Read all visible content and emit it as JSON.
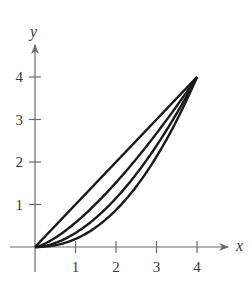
{
  "chart_data": {
    "type": "line",
    "title": "",
    "xlabel": "x",
    "ylabel": "y",
    "xlim": [
      0,
      4.6
    ],
    "ylim": [
      0,
      4.6
    ],
    "x_ticks": [
      "1",
      "2",
      "3",
      "4"
    ],
    "y_ticks": [
      "1",
      "2",
      "3",
      "4"
    ],
    "grid": false,
    "legend": null,
    "series": [
      {
        "name": "curve-1",
        "exponent": 1.0,
        "points": [
          [
            0,
            0
          ],
          [
            1,
            1
          ],
          [
            2,
            2
          ],
          [
            3,
            3
          ],
          [
            4,
            4
          ]
        ]
      },
      {
        "name": "curve-2",
        "exponent": 1.4,
        "points": [
          [
            0,
            0
          ],
          [
            1,
            0.57
          ],
          [
            2,
            1.52
          ],
          [
            3,
            2.83
          ],
          [
            4,
            4
          ]
        ]
      },
      {
        "name": "curve-3",
        "exponent": 1.8,
        "points": [
          [
            0,
            0
          ],
          [
            1,
            0.33
          ],
          [
            2,
            1.15
          ],
          [
            3,
            2.53
          ],
          [
            4,
            4
          ]
        ]
      },
      {
        "name": "curve-4",
        "exponent": 2.2,
        "points": [
          [
            0,
            0
          ],
          [
            1,
            0.19
          ],
          [
            2,
            0.87
          ],
          [
            3,
            2.27
          ],
          [
            4,
            4
          ]
        ]
      }
    ],
    "note": "Four increasing curves from (0,0) to (4,4), y = 4*(x/4)^n"
  },
  "style": {
    "axis_color": "#6b6b6b",
    "curve_color": "#1a1a1a"
  }
}
